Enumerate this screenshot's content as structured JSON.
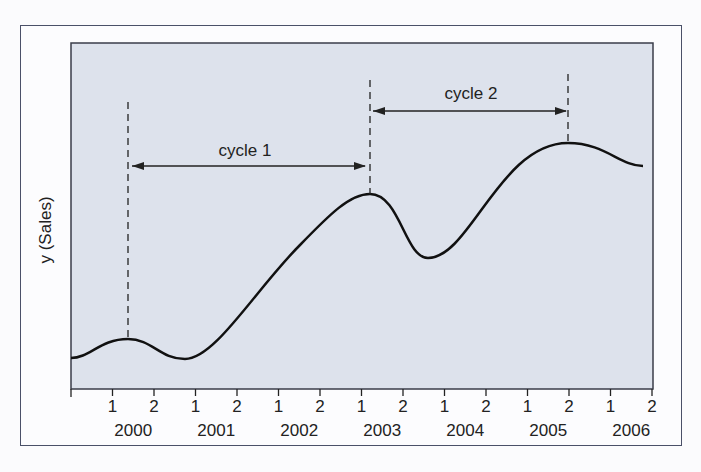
{
  "chart_data": {
    "type": "line",
    "title": "",
    "xlabel": "",
    "ylabel": "y (Sales)",
    "x_ticks": [
      {
        "half": "1",
        "year": "2000"
      },
      {
        "half": "2"
      },
      {
        "half": "1",
        "year": "2001"
      },
      {
        "half": "2"
      },
      {
        "half": "1",
        "year": "2002"
      },
      {
        "half": "2"
      },
      {
        "half": "1",
        "year": "2003"
      },
      {
        "half": "2"
      },
      {
        "half": "1",
        "year": "2004"
      },
      {
        "half": "2"
      },
      {
        "half": "1",
        "year": "2005"
      },
      {
        "half": "2"
      },
      {
        "half": "1",
        "year": "2006"
      },
      {
        "half": "2"
      }
    ],
    "x_tick_labels": [
      "1",
      "2",
      "1",
      "2",
      "1",
      "2",
      "1",
      "2",
      "1",
      "2",
      "1",
      "2",
      "1",
      "2"
    ],
    "year_labels": [
      "2000",
      "2001",
      "2002",
      "2003",
      "2004",
      "2005",
      "2006"
    ],
    "series": [
      {
        "name": "Sales",
        "points_description": "smooth cyclical curve with peaks at 2000-H1, 2003-H1, 2005-H2",
        "x": [
          0,
          0.7,
          1.4,
          2.5,
          3.5,
          4.5,
          5.5,
          6.2,
          6.9,
          7.7,
          8.5,
          9.5,
          10.4,
          11.2,
          12.0,
          12.8,
          13.7
        ],
        "y": [
          1,
          3,
          4,
          1,
          5,
          15,
          25,
          31,
          33,
          25,
          21,
          27,
          37,
          42,
          41,
          39,
          37
        ]
      }
    ],
    "annotations": [
      {
        "label": "cycle 1",
        "from": "2000 H1 (peak)",
        "to": "2003 H1 (peak)"
      },
      {
        "label": "cycle 2",
        "from": "2003 H1 (peak)",
        "to": "2005 H2 (peak)"
      }
    ],
    "grid": false,
    "legend": "none"
  },
  "labels": {
    "ylabel": "y (Sales)",
    "cycle1": "cycle 1",
    "cycle2": "cycle 2"
  }
}
